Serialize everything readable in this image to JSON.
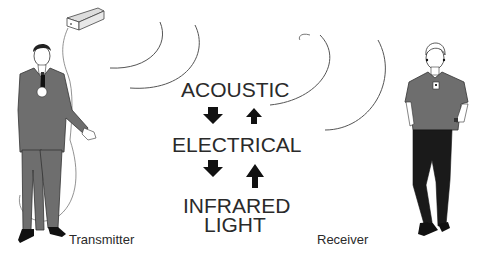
{
  "diagram": {
    "stages": [
      {
        "label": "ACOUSTIC"
      },
      {
        "label": "ELECTRICAL"
      },
      {
        "label": "INFRARED",
        "label2": "LIGHT"
      }
    ],
    "arrows": [
      {
        "direction": "down",
        "between": "ACOUSTIC-ELECTRICAL"
      },
      {
        "direction": "up",
        "between": "ELECTRICAL-ACOUSTIC"
      },
      {
        "direction": "down",
        "between": "ELECTRICAL-INFRARED LIGHT"
      },
      {
        "direction": "up",
        "between": "INFRARED LIGHT-ELECTRICAL"
      }
    ],
    "transmitter_label": "Transmitter",
    "receiver_label": "Receiver",
    "colors": {
      "text": "#2a2a2a",
      "figure_fill": "#6e6e6e",
      "dark_fill": "#1a1a1a",
      "line": "#555555",
      "background": "#ffffff"
    }
  }
}
